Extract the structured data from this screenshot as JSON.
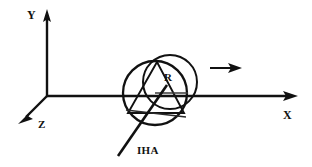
{
  "figure": {
    "type": "engineering-diagram",
    "background_color": "#ffffff",
    "stroke_color": "#111111",
    "width": 312,
    "height": 167
  },
  "axes": {
    "origin": {
      "x": 47,
      "y": 96
    },
    "y_axis": {
      "label": "Y",
      "direction": "up",
      "from": {
        "x": 47,
        "y": 96
      },
      "to": {
        "x": 47,
        "y": 12
      }
    },
    "x_axis": {
      "label": "X",
      "direction": "right",
      "from": {
        "x": 47,
        "y": 96
      },
      "to": {
        "x": 297,
        "y": 96
      }
    },
    "z_axis": {
      "label": "Z",
      "direction": "down-left",
      "from": {
        "x": 47,
        "y": 96
      },
      "to": {
        "x": 21,
        "y": 121
      }
    }
  },
  "disc": {
    "front_circle": {
      "cx": 155,
      "cy": 93,
      "r": 32
    },
    "back_circle": {
      "cx": 170,
      "cy": 82,
      "r": 27
    },
    "radius_label": "R",
    "radius_line": {
      "from": {
        "x": 155,
        "y": 93
      },
      "to": {
        "x": 187,
        "y": 93
      }
    },
    "inscribed_triangle": [
      {
        "x": 157,
        "y": 62
      },
      {
        "x": 128,
        "y": 113
      },
      {
        "x": 184,
        "y": 113
      }
    ],
    "base_chord": {
      "from": {
        "x": 126,
        "y": 110
      },
      "to": {
        "x": 185,
        "y": 117
      }
    }
  },
  "iha": {
    "label": "IHA",
    "full_name": "Instantaneous Helical Axis",
    "from": {
      "x": 166,
      "y": 86
    },
    "to": {
      "x": 118,
      "y": 155
    }
  },
  "velocity_arrow": {
    "label": "",
    "from": {
      "x": 210,
      "y": 68
    },
    "to": {
      "x": 241,
      "y": 68
    },
    "direction": "right"
  },
  "labels": {
    "y": "Y",
    "x": "X",
    "z": "Z",
    "r": "R",
    "iha": "IHA"
  }
}
